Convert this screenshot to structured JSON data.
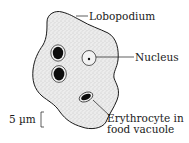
{
  "figure": {
    "colors": {
      "outline": "#1a1a1a",
      "cytoplasm": "#e9e9e9",
      "stipple": "#9a9a9a",
      "vacuole_fill": "#f4f4f4",
      "inclusion": "#0d0d0d"
    }
  },
  "labels": {
    "lobopodium": "Lobopodium",
    "nucleus": "Nucleus",
    "erythrocyte_line1": "Erythrocyte in",
    "erythrocyte_line2": "food vacuole"
  },
  "scale_bar": {
    "label": "5 µm"
  }
}
